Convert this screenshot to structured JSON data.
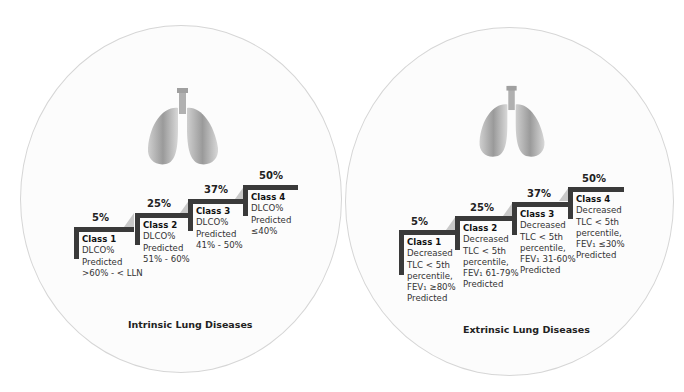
{
  "panels": [
    {
      "title": "Intrinsic Lung Diseases",
      "icon": "lungs-icon",
      "classes": [
        {
          "percent": "5%",
          "name": "Class 1",
          "lines": [
            "DLCO%",
            "Predicted",
            ">60% - < LLN"
          ]
        },
        {
          "percent": "25%",
          "name": "Class 2",
          "lines": [
            "DLCO%",
            "Predicted",
            "51% - 60%"
          ]
        },
        {
          "percent": "37%",
          "name": "Class 3",
          "lines": [
            "DLCO%",
            "Predicted",
            "41% - 50%"
          ]
        },
        {
          "percent": "50%",
          "name": "Class 4",
          "lines": [
            "DLCO%",
            "Predicted",
            "≤40%"
          ]
        }
      ]
    },
    {
      "title": "Extrinsic Lung Diseases",
      "icon": "lungs-icon",
      "classes": [
        {
          "percent": "5%",
          "name": "Class 1",
          "lines": [
            "Decreased",
            "TLC < 5th",
            "percentile,",
            "FEV₁ ≥80%",
            "Predicted"
          ]
        },
        {
          "percent": "25%",
          "name": "Class 2",
          "lines": [
            "Decreased",
            "TLC < 5th",
            "percentile,",
            "FEV₁ 61-79%",
            "Predicted"
          ]
        },
        {
          "percent": "37%",
          "name": "Class 3",
          "lines": [
            "Decreased",
            "TLC < 5th",
            "percentile,",
            "FEV₁ 31-60%",
            "Predicted"
          ]
        },
        {
          "percent": "50%",
          "name": "Class 4",
          "lines": [
            "Decreased",
            "TLC < 5th",
            "percentile,",
            "FEV₁  ≤30%",
            "Predicted"
          ]
        }
      ]
    }
  ],
  "colors": {
    "step_bar": "#3a3a3a",
    "ramp": "#c9c9c9",
    "circle_border": "#d6d6d6"
  }
}
